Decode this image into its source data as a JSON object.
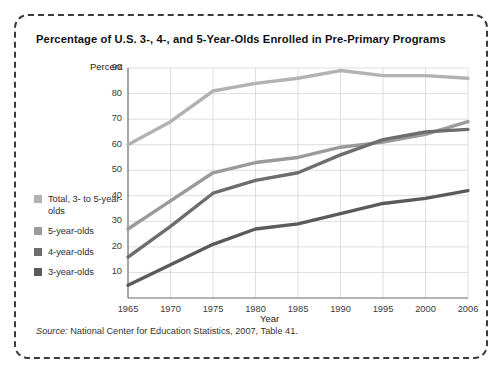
{
  "figure": {
    "title": "Percentage of U.S. 3-, 4-, and 5-Year-Olds Enrolled in Pre-Primary Programs",
    "source_prefix": "Source:",
    "source_text": " National Center for Education Statistics, 2007, Table 41."
  },
  "legend": {
    "items": [
      {
        "label": "Total, 3- to 5-year-olds",
        "color": "#b2b2b2"
      },
      {
        "label": "5-year-olds",
        "color": "#9a9a9a"
      },
      {
        "label": "4-year-olds",
        "color": "#6d6d6d"
      },
      {
        "label": "3-year-olds",
        "color": "#5a5a5a"
      }
    ]
  },
  "chart_data": {
    "type": "line",
    "title": "Percentage of U.S. 3-, 4-, and 5-Year-Olds Enrolled in Pre-Primary Programs",
    "xlabel": "Year",
    "ylabel": "Percent",
    "x": [
      1965,
      1970,
      1975,
      1980,
      1985,
      1990,
      1995,
      2000,
      2006
    ],
    "xticklabels": [
      "1965",
      "1970",
      "1975",
      "1980",
      "1985",
      "1990",
      "1995",
      "2000",
      "2006"
    ],
    "yticklabels": [
      "10",
      "20",
      "30",
      "40",
      "50",
      "60",
      "70",
      "80",
      "90"
    ],
    "ylim": [
      0,
      90
    ],
    "xlim": [
      1965,
      2006
    ],
    "grid": true,
    "legend_position": "left",
    "series": [
      {
        "name": "5-year-olds",
        "color": "#b2b2b2",
        "values": [
          60,
          69,
          81,
          84,
          86,
          89,
          87,
          87,
          86
        ]
      },
      {
        "name": "Total, 3- to 5-year-olds",
        "color": "#9a9a9a",
        "values": [
          27,
          38,
          49,
          53,
          55,
          59,
          61,
          64,
          69
        ]
      },
      {
        "name": "4-year-olds",
        "color": "#6d6d6d",
        "values": [
          16,
          28,
          41,
          46,
          49,
          56,
          62,
          65,
          66
        ]
      },
      {
        "name": "3-year-olds",
        "color": "#5a5a5a",
        "values": [
          5,
          13,
          21,
          27,
          29,
          33,
          37,
          39,
          42
        ]
      }
    ]
  }
}
